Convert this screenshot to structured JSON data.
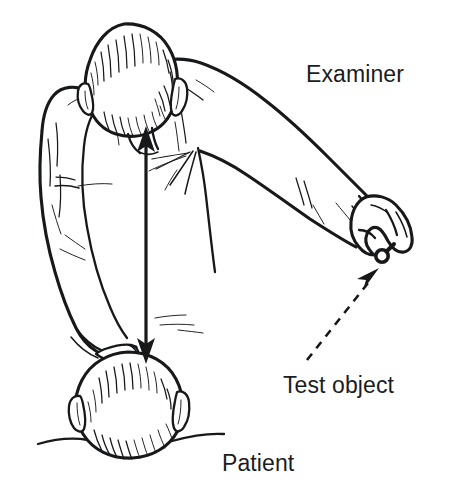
{
  "figure": {
    "kind": "medical-line-illustration",
    "background_color": "#ffffff",
    "ink_color": "#17181a",
    "text_color": "#1b1c1e"
  },
  "labels": {
    "examiner": "Examiner",
    "test_object": "Test object",
    "patient": "Patient"
  },
  "annotations": {
    "gaze_axis": {
      "name": "double-headed vertical arrow",
      "description": "Double-headed arrow linking examiner's eyes to patient's head",
      "style": "solid",
      "arrowheads": "both",
      "x": 146,
      "y_top": 136,
      "y_bottom": 354
    },
    "leader": {
      "name": "dashed leader arrow",
      "description": "Dashed arrow from the Test object label to the object held in the examiner's hand",
      "style": "dashed",
      "arrowheads": "end",
      "x_start": 310,
      "y_start": 356,
      "x_end": 381,
      "y_end": 262
    }
  },
  "figures": {
    "examiner": {
      "name": "examiner",
      "pose": "leaning forward over seated patient, right arm extended down and to the right",
      "head_center_x": 124,
      "head_center_y": 75
    },
    "patient": {
      "name": "patient",
      "pose": "seated, head seen from above and behind",
      "head_center_x": 128,
      "head_center_y": 400
    },
    "test_object": {
      "name": "test object",
      "description": "Small white-headed pin on a short stem held between finger and thumb",
      "x": 388,
      "y": 253
    }
  }
}
